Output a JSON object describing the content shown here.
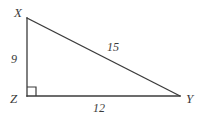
{
  "figure": {
    "type": "right-triangle",
    "stroke_color": "#3b3b3b",
    "background_color": "#ffffff",
    "stroke_width": 1.3,
    "vertices": [
      {
        "id": "X",
        "label": "X",
        "x": 27,
        "y": 18
      },
      {
        "id": "Z",
        "label": "Z",
        "x": 27,
        "y": 96
      },
      {
        "id": "Y",
        "label": "Y",
        "x": 180,
        "y": 96
      }
    ],
    "sides": [
      {
        "id": "XZ",
        "label": "9",
        "from": "X",
        "to": "Z",
        "orientation": "vertical"
      },
      {
        "id": "XY",
        "label": "15",
        "from": "X",
        "to": "Y",
        "orientation": "hypotenuse"
      },
      {
        "id": "ZY",
        "label": "12",
        "from": "Z",
        "to": "Y",
        "orientation": "horizontal"
      }
    ],
    "right_angle": {
      "at_vertex": "Z",
      "marker": "square",
      "size": 9
    }
  }
}
